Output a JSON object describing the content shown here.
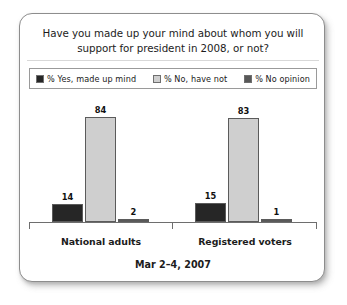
{
  "card": {
    "title_line1": "Have you made up your mind about whom you will",
    "title_line2": "support for president in 2008, or not?",
    "footer": "Mar 2–4, 2007"
  },
  "legend": {
    "items": [
      {
        "label": "% Yes, made up mind",
        "color": "#262626"
      },
      {
        "label": "% No, have not",
        "color": "#cfcfcf"
      },
      {
        "label": "% No opinion",
        "color": "#585858"
      }
    ]
  },
  "chart_data": {
    "type": "bar",
    "title": "Have you made up your mind about whom you will support for president in 2008, or not?",
    "subtitle": "Mar 2–4, 2007",
    "xlabel": "",
    "ylabel": "",
    "ylim": [
      0,
      100
    ],
    "grid": false,
    "legend_position": "top",
    "categories": [
      "National adults",
      "Registered voters"
    ],
    "series": [
      {
        "name": "% Yes, made up mind",
        "color": "#262626",
        "values": [
          14,
          15
        ]
      },
      {
        "name": "% No, have not",
        "color": "#cfcfcf",
        "values": [
          84,
          83
        ]
      },
      {
        "name": "% No opinion",
        "color": "#585858",
        "values": [
          2,
          1
        ]
      }
    ]
  }
}
